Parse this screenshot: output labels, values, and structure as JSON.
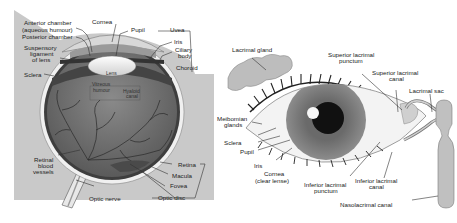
{
  "left_diagram": {
    "name": "Cross-section of the human eye",
    "labels": {
      "anterior_chamber": "Anterior chamber",
      "aqueous_humour": "(aqueous humour)",
      "posterior_chamber": "Posterior chamber",
      "cornea": "Cornea",
      "pupil": "Pupil",
      "uvea": "Uvea",
      "iris": "Iris",
      "ciliary_body_1": "Ciliary",
      "ciliary_body_2": "body",
      "choroid": "Choroid",
      "suspensory_1": "Suspensory",
      "suspensory_2": "ligament",
      "suspensory_3": "of lens",
      "sclera": "Sclera",
      "lens": "Lens",
      "vitreous_1": "Vitreous",
      "vitreous_2": "humour",
      "hyaloid_1": "Hyaloid",
      "hyaloid_2": "canal",
      "retinal_1": "Retinal",
      "retinal_2": "blood",
      "retinal_3": "vessels",
      "retina": "Retina",
      "macula": "Macula",
      "fovea": "Fovea",
      "optic_disc": "Optic disc",
      "optic_nerve": "Optic nerve"
    }
  },
  "right_diagram": {
    "name": "External eye and lacrimal apparatus",
    "labels": {
      "lacrimal_gland": "Lacrimal gland",
      "superior_punctum_1": "Superior lacrimal",
      "superior_punctum_2": "punctum",
      "superior_canal_1": "Superior lacrimal",
      "superior_canal_2": "canal",
      "lacrimal_sac": "Lacrimal sac",
      "meibomian_1": "Meibomian",
      "meibomian_2": "glands",
      "sclera": "Sclera",
      "pupil": "Pupil",
      "iris": "Iris",
      "cornea_1": "Cornea",
      "cornea_2": "(clear lense)",
      "inferior_punctum_1": "Inferior lacrimal",
      "inferior_punctum_2": "punctum",
      "inferior_canal_1": "Inferior lacrimal",
      "inferior_canal_2": "canal",
      "nasolacrimal": "Nasolacrimal canal"
    }
  },
  "colors": {
    "panel_bg": "#c8c8c8",
    "eyeball_dark": "#6e6e6e",
    "sclera_white": "#f2f2f2",
    "iris_gray": "#7d7d7d",
    "pupil_black": "#111111",
    "gland_gray": "#b8b8b8"
  }
}
